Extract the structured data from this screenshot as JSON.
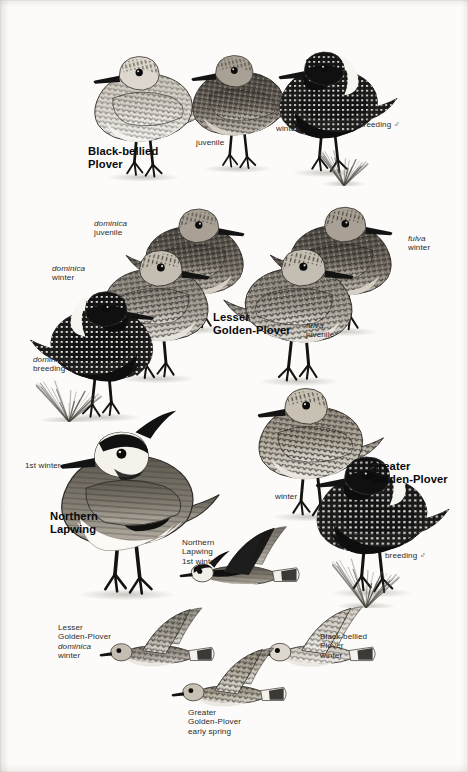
{
  "plate": {
    "kind": "field-guide-illustration-plate",
    "background": "#fcfbf9",
    "ink": "#17181a",
    "width": 468,
    "height": 772
  },
  "species_names": [
    {
      "id": "black-bellied-plover",
      "lines": [
        "Black-bellied",
        "Plover"
      ],
      "x": 88,
      "y": 145
    },
    {
      "id": "lesser-golden-plover",
      "lines": [
        "Lesser",
        "Golden-Plover"
      ],
      "x": 213,
      "y": 311
    },
    {
      "id": "northern-lapwing",
      "lines": [
        "Northern",
        "Lapwing"
      ],
      "x": 50,
      "y": 510
    },
    {
      "id": "greater-golden-plover",
      "lines": [
        "Greater",
        "Golden-Plover"
      ],
      "x": 370,
      "y": 460
    }
  ],
  "captions": [
    {
      "id": "bbpl-juvenile",
      "lines": [
        {
          "text": "juvenile"
        }
      ],
      "x": 196,
      "y": 138,
      "align": "left"
    },
    {
      "id": "bbpl-winter",
      "lines": [
        {
          "text": "winter"
        }
      ],
      "x": 276,
      "y": 124,
      "align": "left"
    },
    {
      "id": "bbpl-breeding-male",
      "lines": [
        {
          "text": "breeding ♂"
        }
      ],
      "x": 359,
      "y": 120,
      "align": "left"
    },
    {
      "id": "lgpl-dominica-juv",
      "lines": [
        {
          "text": "dominica",
          "italic": true
        },
        {
          "text": "juvenile"
        }
      ],
      "x": 94,
      "y": 219,
      "align": "left"
    },
    {
      "id": "lgpl-dominica-winter",
      "lines": [
        {
          "text": "dominica",
          "italic": true
        },
        {
          "text": "winter"
        }
      ],
      "x": 52,
      "y": 264,
      "align": "left"
    },
    {
      "id": "lgpl-dominica-breed",
      "lines": [
        {
          "text": "dominica",
          "italic": true
        },
        {
          "text": "breeding ♂"
        }
      ],
      "x": 33,
      "y": 355,
      "align": "left"
    },
    {
      "id": "lgpl-fulva-winter",
      "lines": [
        {
          "text": "fulva",
          "italic": true
        },
        {
          "text": "winter"
        }
      ],
      "x": 408,
      "y": 234,
      "align": "left"
    },
    {
      "id": "lgpl-fulva-juvenile",
      "lines": [
        {
          "text": "fulva",
          "italic": true
        },
        {
          "text": "juvenile"
        }
      ],
      "x": 306,
      "y": 321,
      "align": "left"
    },
    {
      "id": "nola-1st-winter",
      "lines": [
        {
          "text": "1st winter"
        }
      ],
      "x": 25,
      "y": 461,
      "align": "left"
    },
    {
      "id": "ggpl-winter",
      "lines": [
        {
          "text": "winter"
        }
      ],
      "x": 275,
      "y": 492,
      "align": "left"
    },
    {
      "id": "ggpl-breeding-male",
      "lines": [
        {
          "text": "breeding ♂"
        }
      ],
      "x": 385,
      "y": 551,
      "align": "left"
    },
    {
      "id": "nola-flight",
      "lines": [
        {
          "text": "Northern"
        },
        {
          "text": "Lapwing"
        },
        {
          "text": "1st winter"
        }
      ],
      "x": 182,
      "y": 538,
      "align": "left"
    },
    {
      "id": "lgpl-flight",
      "lines": [
        {
          "text": "Lesser"
        },
        {
          "text": "Golden-Plover"
        },
        {
          "text": "dominica",
          "italic": true
        },
        {
          "text": "winter"
        }
      ],
      "x": 58,
      "y": 623,
      "align": "left"
    },
    {
      "id": "bbpl-flight",
      "lines": [
        {
          "text": "Black-bellied"
        },
        {
          "text": "Plover"
        },
        {
          "text": "winter"
        }
      ],
      "x": 320,
      "y": 632,
      "align": "left"
    },
    {
      "id": "ggpl-flight",
      "lines": [
        {
          "text": "Greater"
        },
        {
          "text": "Golden-Plover"
        },
        {
          "text": "early spring"
        }
      ],
      "x": 188,
      "y": 708,
      "align": "left"
    }
  ],
  "figures": [
    {
      "id": "bbpl-juvenile-fig",
      "name": "black-bellied-plover-juvenile",
      "pose": "standing-left",
      "x": 60,
      "y": 20,
      "w": 160,
      "h": 185,
      "tone": "pale-scaly",
      "scale": 1.0
    },
    {
      "id": "bbpl-winter-fig",
      "name": "black-bellied-plover-winter",
      "pose": "standing-left",
      "x": 160,
      "y": 18,
      "w": 150,
      "h": 180,
      "tone": "dark-scaly",
      "scale": 0.97
    },
    {
      "id": "bbpl-breeding-fig",
      "name": "black-bellied-plover-breeding-male",
      "pose": "standing-left",
      "x": 245,
      "y": 18,
      "w": 160,
      "h": 180,
      "tone": "black-belly",
      "scale": 0.99
    },
    {
      "id": "lgpl-dominica-juv-fig",
      "name": "lesser-golden-plover-dominica-juvenile",
      "pose": "standing-right",
      "x": 118,
      "y": 190,
      "w": 160,
      "h": 150,
      "tone": "dark-scaly",
      "scale": 0.93
    },
    {
      "id": "lgpl-dominica-win-fig",
      "name": "lesser-golden-plover-dominica-winter",
      "pose": "standing-right",
      "x": 75,
      "y": 230,
      "w": 170,
      "h": 160,
      "tone": "mid-scaly",
      "scale": 0.95
    },
    {
      "id": "lgpl-dominica-breed-fig",
      "name": "lesser-golden-plover-dominica-breeding",
      "pose": "standing-right",
      "x": 18,
      "y": 275,
      "w": 175,
      "h": 150,
      "tone": "black-belly",
      "scale": 0.95
    },
    {
      "id": "lgpl-fulva-winter-fig",
      "name": "lesser-golden-plover-fulva-winter",
      "pose": "standing-right",
      "x": 262,
      "y": 190,
      "w": 165,
      "h": 150,
      "tone": "dark-scaly",
      "scale": 0.93
    },
    {
      "id": "lgpl-fulva-juv-fig",
      "name": "lesser-golden-plover-fulva-juvenile",
      "pose": "standing-right",
      "x": 215,
      "y": 228,
      "w": 175,
      "h": 165,
      "tone": "mid-scaly",
      "scale": 0.95
    },
    {
      "id": "nola-standing-fig",
      "name": "northern-lapwing-1st-winter",
      "pose": "standing-left",
      "x": 15,
      "y": 390,
      "w": 215,
      "h": 235,
      "tone": "lapwing",
      "scale": 1.0
    },
    {
      "id": "ggpl-winter-fig",
      "name": "greater-golden-plover-winter",
      "pose": "standing-left",
      "x": 222,
      "y": 368,
      "w": 170,
      "h": 160,
      "tone": "golden-scaly",
      "scale": 0.98
    },
    {
      "id": "ggpl-breeding-fig",
      "name": "greater-golden-plover-breeding-male",
      "pose": "standing-left",
      "x": 278,
      "y": 430,
      "w": 180,
      "h": 180,
      "tone": "black-belly",
      "scale": 1.0
    },
    {
      "id": "nola-flight-fig",
      "name": "northern-lapwing-flight",
      "pose": "flight",
      "x": 180,
      "y": 500,
      "w": 120,
      "h": 115,
      "tone": "lapwing",
      "scale": 1.0
    },
    {
      "id": "lgpl-flight-fig",
      "name": "lesser-golden-plover-flight",
      "pose": "flight",
      "x": 100,
      "y": 590,
      "w": 115,
      "h": 95,
      "tone": "mid-scaly",
      "scale": 0.92
    },
    {
      "id": "bbpl-flight-fig",
      "name": "black-bellied-plover-flight",
      "pose": "flight",
      "x": 258,
      "y": 588,
      "w": 118,
      "h": 98,
      "tone": "pale-scaly",
      "scale": 0.94
    },
    {
      "id": "ggpl-flight-fig",
      "name": "greater-golden-plover-flight",
      "pose": "flight",
      "x": 172,
      "y": 630,
      "w": 115,
      "h": 95,
      "tone": "golden-scaly",
      "scale": 0.92
    }
  ],
  "ground_tufts": [
    {
      "id": "tuft-bbpl",
      "x": 318,
      "y": 150,
      "w": 52,
      "h": 36
    },
    {
      "id": "tuft-lgpl",
      "x": 34,
      "y": 380,
      "w": 70,
      "h": 42
    },
    {
      "id": "tuft-ggpl",
      "x": 330,
      "y": 558,
      "w": 72,
      "h": 50
    }
  ]
}
